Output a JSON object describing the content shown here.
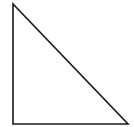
{
  "diagram": {
    "shape": "right-triangle",
    "stroke_color": "#1a1a1a",
    "fill_color": "#ffffff",
    "background": "#ffffff",
    "stroke_width": 1.6,
    "vertices": [
      {
        "name": "top",
        "x": 13,
        "y": 4
      },
      {
        "name": "bottom-left",
        "x": 13,
        "y": 124
      },
      {
        "name": "bottom-right",
        "x": 128,
        "y": 124
      }
    ]
  }
}
